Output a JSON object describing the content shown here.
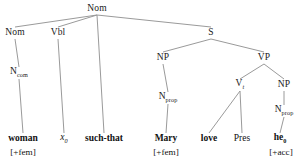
{
  "diagram": {
    "type": "syntax-tree",
    "line_color": "#9a9a9a",
    "text_color": "#111111",
    "background": "#ffffff",
    "nodes": [
      {
        "id": "root",
        "label": "Nom",
        "sub": "",
        "x": 97,
        "y": 9
      },
      {
        "id": "nom2",
        "label": "Nom",
        "sub": "",
        "x": 15,
        "y": 33
      },
      {
        "id": "vbl",
        "label": "Vbl",
        "sub": "",
        "x": 58,
        "y": 33
      },
      {
        "id": "s",
        "label": "S",
        "sub": "",
        "x": 211,
        "y": 33
      },
      {
        "id": "ncom",
        "label": "N",
        "sub": "com",
        "x": 19,
        "y": 73
      },
      {
        "id": "np1",
        "label": "NP",
        "sub": "",
        "x": 163,
        "y": 58
      },
      {
        "id": "vp",
        "label": "VP",
        "sub": "",
        "x": 264,
        "y": 58
      },
      {
        "id": "nprop1",
        "label": "N",
        "sub": "prop",
        "x": 168,
        "y": 98
      },
      {
        "id": "vt",
        "label": "V",
        "sub": "t",
        "x": 240,
        "y": 85
      },
      {
        "id": "np2",
        "label": "NP",
        "sub": "",
        "x": 284,
        "y": 85
      },
      {
        "id": "nprop2",
        "label": "N",
        "sub": "prop",
        "x": 284,
        "y": 111
      }
    ],
    "edges": [
      {
        "from": "root",
        "to": "nom2"
      },
      {
        "from": "root",
        "to": "vbl"
      },
      {
        "from": "root",
        "to": "suchthat"
      },
      {
        "from": "root",
        "to": "s"
      },
      {
        "from": "nom2",
        "to": "ncom"
      },
      {
        "from": "ncom",
        "to": "woman"
      },
      {
        "from": "vbl",
        "to": "x0"
      },
      {
        "from": "s",
        "to": "np1"
      },
      {
        "from": "s",
        "to": "vp"
      },
      {
        "from": "np1",
        "to": "nprop1"
      },
      {
        "from": "nprop1",
        "to": "mary"
      },
      {
        "from": "vp",
        "to": "vt"
      },
      {
        "from": "vp",
        "to": "np2"
      },
      {
        "from": "vt",
        "to": "love"
      },
      {
        "from": "vt",
        "to": "pres"
      },
      {
        "from": "np2",
        "to": "nprop2"
      },
      {
        "from": "nprop2",
        "to": "he0"
      }
    ],
    "leaves": [
      {
        "id": "woman",
        "label": "woman",
        "sub": "",
        "style": "bold",
        "x": 23,
        "y": 139,
        "feature": "[+fem]",
        "feature_x": 23,
        "feature_y": 153
      },
      {
        "id": "x0",
        "label": "x",
        "sub": "0",
        "style": "italic",
        "x": 64,
        "y": 139,
        "feature": "",
        "feature_x": 0,
        "feature_y": 0
      },
      {
        "id": "suchthat",
        "label": "such-that",
        "sub": "",
        "style": "bold",
        "x": 104,
        "y": 139,
        "feature": "",
        "feature_x": 0,
        "feature_y": 0
      },
      {
        "id": "mary",
        "label": "Mary",
        "sub": "",
        "style": "bold",
        "x": 166,
        "y": 139,
        "feature": "[+fem]",
        "feature_x": 166,
        "feature_y": 153
      },
      {
        "id": "love",
        "label": "love",
        "sub": "",
        "style": "bold",
        "x": 209,
        "y": 139,
        "feature": "",
        "feature_x": 0,
        "feature_y": 0
      },
      {
        "id": "pres",
        "label": "Pres",
        "sub": "",
        "style": "plain",
        "x": 242,
        "y": 139,
        "feature": "",
        "feature_x": 0,
        "feature_y": 0
      },
      {
        "id": "he0",
        "label": "he",
        "sub": "0",
        "style": "bold",
        "x": 280,
        "y": 139,
        "feature": "[+acc]",
        "feature_x": 281,
        "feature_y": 153
      }
    ]
  }
}
